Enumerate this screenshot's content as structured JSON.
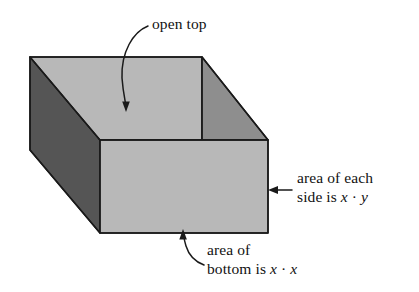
{
  "figure": {
    "type": "geometry-diagram",
    "colors": {
      "background": "#ffffff",
      "outer_left_face": "#555555",
      "inner_floor_and_rim": "#b8b8b8",
      "inner_right_wall": "#8e8e8e",
      "outline": "#1a1a1a",
      "text": "#111111"
    },
    "shape": {
      "name": "rectangular box with open top",
      "faces": [
        {
          "name": "left-outer-side",
          "shade": "dark"
        },
        {
          "name": "top-rim-and-back-inner-wall",
          "shade": "light"
        },
        {
          "name": "right-inner-wall",
          "shade": "medium"
        },
        {
          "name": "front-outer-side",
          "shade": "light"
        }
      ]
    },
    "annotations": [
      {
        "name": "open-top",
        "text": "open top",
        "pointer": "curved-arrow-down",
        "target": "box interior"
      },
      {
        "name": "side-area",
        "line1": "area of each",
        "line2_prefix": "side is ",
        "line2_var1": "x",
        "line2_op": " · ",
        "line2_var2": "y",
        "pointer": "straight-arrow-left",
        "target": "front side face"
      },
      {
        "name": "bottom-area",
        "line1": "area of",
        "line2_prefix": "bottom is ",
        "line2_var1": "x",
        "line2_op": " · ",
        "line2_var2": "x",
        "pointer": "curved-arrow-up",
        "target": "bottom edge of box"
      }
    ]
  },
  "labels": {
    "open_top": "open top",
    "side_line1": "area of each",
    "side_line2_prefix": "side is ",
    "side_var_x": "x",
    "side_dot": " · ",
    "side_var_y": "y",
    "bottom_line1": "area of",
    "bottom_line2_prefix": "bottom is ",
    "bottom_var_x1": "x",
    "bottom_dot": " · ",
    "bottom_var_x2": "x"
  }
}
